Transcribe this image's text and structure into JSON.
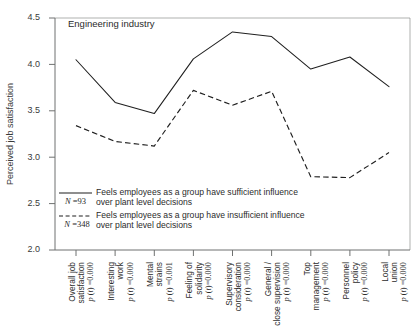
{
  "chart_data": {
    "type": "line",
    "title": "Engineering industry",
    "xlabel": "",
    "ylabel": "Perceived job satisfaction",
    "ylim": [
      2.0,
      4.5
    ],
    "yticks": [
      "2.0",
      "2.5",
      "3.0",
      "3.5",
      "4.0",
      "4.5"
    ],
    "ytick_values": [
      2.0,
      2.5,
      3.0,
      3.5,
      4.0,
      4.5
    ],
    "grid": false,
    "legend_position": "inside-lower-left",
    "categories": [
      "Overall job satisfaction",
      "Interesting work",
      "Mental strains",
      "Feeling of solidarity",
      "Supervisory consideration",
      "General / close supervision",
      "Top management",
      "Personnel policy",
      "Local union"
    ],
    "category_significance": [
      "p (t) =0.000",
      "p (t) =0.000",
      "p (t) =0.001",
      "p (t)=0.000",
      "p (t) =0.000",
      "p (t) =0.000",
      "p (t) =0.000",
      "p (t) =0.000",
      "p (t) =0.000"
    ],
    "series": [
      {
        "name": "Feels employees as a group have sufficient influence over plant level decisions",
        "n_label": "N =93",
        "style": "solid",
        "values": [
          4.05,
          3.59,
          3.47,
          4.06,
          4.35,
          4.3,
          3.95,
          4.08,
          3.76
        ]
      },
      {
        "name": "Feels employees as a group have insufficient influence over plant level decisions",
        "n_label": "N =348",
        "style": "dashed",
        "values": [
          3.34,
          3.17,
          3.12,
          3.72,
          3.56,
          3.71,
          2.79,
          2.78,
          3.05
        ]
      }
    ]
  },
  "legend": {
    "entries": [
      {
        "n_label": "N =93",
        "line1": "Feels employees as a group have sufficient influence",
        "line2": "over plant level decisions"
      },
      {
        "n_label": "N =348",
        "line1": "Feels employees as a group have insufficient influence",
        "line2": "over plant level decisions"
      }
    ]
  },
  "colors": {
    "ink": "#1f1f1f",
    "axis": "#6f7170",
    "text": "#2b2b2b",
    "background": "#ffffff"
  }
}
